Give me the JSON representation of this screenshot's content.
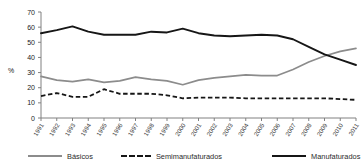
{
  "chart_data": {
    "type": "line",
    "title": "",
    "xlabel": "",
    "ylabel": "%",
    "ylim": [
      0,
      70
    ],
    "ytick_step": 10,
    "yticks": [
      0,
      10,
      20,
      30,
      40,
      50,
      60,
      70
    ],
    "grid": false,
    "legend_position": "bottom",
    "categories": [
      "1991",
      "1992",
      "1993",
      "1994",
      "1995",
      "1996",
      "1997",
      "1998",
      "1999",
      "2000",
      "2001",
      "2002",
      "2003",
      "2004",
      "2005",
      "2006",
      "2007",
      "2008",
      "2009",
      "2010",
      "2011"
    ],
    "series": [
      {
        "name": "Básicos",
        "color": "#8c8c8c",
        "style": "solid",
        "values": [
          27.5,
          25.0,
          24.0,
          25.5,
          23.5,
          24.5,
          27.0,
          25.5,
          24.5,
          22.0,
          25.0,
          26.5,
          27.5,
          28.5,
          28.0,
          28.0,
          32.0,
          37.0,
          41.0,
          44.0,
          46.0
        ]
      },
      {
        "name": "Semimanufaturados",
        "color": "#161616",
        "style": "dashed",
        "values": [
          14.5,
          16.5,
          14.0,
          14.0,
          19.0,
          16.0,
          16.0,
          16.0,
          15.0,
          13.0,
          13.5,
          13.5,
          13.5,
          13.0,
          13.0,
          13.0,
          13.0,
          13.0,
          13.0,
          12.5,
          12.0
        ]
      },
      {
        "name": "Manufaturados",
        "color": "#161616",
        "style": "solid",
        "values": [
          56.0,
          58.0,
          60.5,
          57.0,
          55.0,
          55.0,
          55.0,
          57.0,
          56.5,
          59.0,
          56.0,
          54.5,
          54.0,
          54.5,
          55.0,
          54.5,
          52.0,
          47.0,
          42.0,
          38.5,
          35.0
        ]
      }
    ]
  },
  "legend": {
    "items": [
      {
        "label": "Básicos"
      },
      {
        "label": "Semimanufaturados"
      },
      {
        "label": "Manufaturados"
      }
    ]
  },
  "axis": {
    "y_title": "%"
  }
}
